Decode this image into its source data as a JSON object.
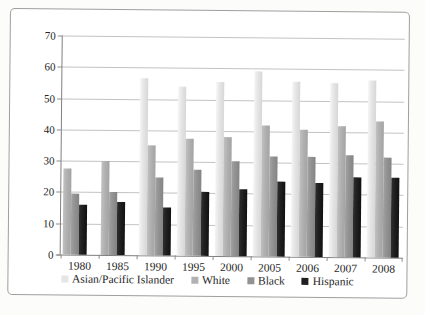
{
  "chart_data": {
    "type": "bar",
    "title": "",
    "xlabel": "",
    "ylabel": "",
    "categories": [
      "1980",
      "1985",
      "1990",
      "1995",
      "2000",
      "2005",
      "2006",
      "2007",
      "2008"
    ],
    "series": [
      {
        "name": "Asian/Pacific Islander",
        "color": "#e5e5e5",
        "values": [
          null,
          null,
          56.5,
          54,
          55.5,
          59,
          56,
          55.5,
          56.5
        ]
      },
      {
        "name": "White",
        "color": "#b1b1b1",
        "values": [
          27.5,
          30,
          35,
          37.5,
          38,
          42,
          40.5,
          42,
          43.5
        ]
      },
      {
        "name": "Black",
        "color": "#929292",
        "values": [
          19.5,
          20,
          25,
          27.5,
          30.5,
          32,
          32,
          32.5,
          32
        ]
      },
      {
        "name": "Hispanic",
        "color": "#1f1f1f",
        "values": [
          16,
          17,
          15.5,
          20.5,
          21.5,
          24,
          23.5,
          25.5,
          25.5
        ]
      }
    ],
    "ylim": [
      0,
      70
    ],
    "ytick_interval": 10,
    "ytick_labels": [
      "70",
      "60",
      "50",
      "40",
      "30",
      "20",
      "10",
      "0"
    ],
    "grid": true,
    "legend_position": "bottom",
    "plot_background": "#ffffff",
    "gridline_color": "#c3c3c3",
    "axis_color": "#7f7f7f",
    "text_color": "#262626"
  }
}
